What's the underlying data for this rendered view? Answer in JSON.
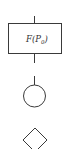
{
  "diagram": {
    "stroke_color": "#3a3a3a",
    "background": "#ffffff",
    "elements": [
      {
        "type": "process-box",
        "label_main": "F(P",
        "label_sub": "0",
        "label_close": ")"
      },
      {
        "type": "connector-circle"
      },
      {
        "type": "decision-diamond"
      }
    ]
  }
}
